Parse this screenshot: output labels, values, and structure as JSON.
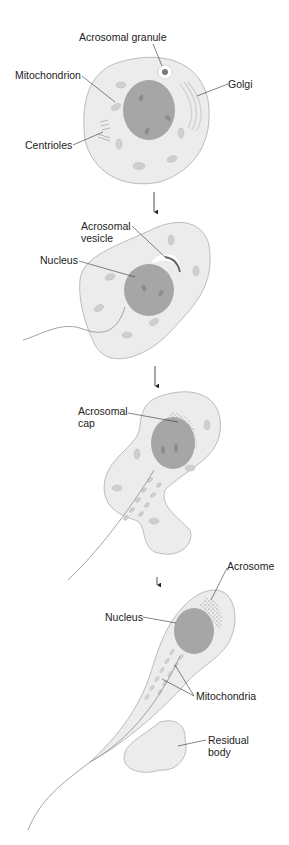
{
  "colors": {
    "cytoplasm": "#ececec",
    "outline": "#bcbcbc",
    "nucleus": "#a6a6a6",
    "organelle": "#cfcfcf",
    "leader": "#333333",
    "text": "#222222"
  },
  "stages": [
    {
      "id": 1,
      "labels": {
        "acrosomal_granule": "Acrosomal granule",
        "mitochondrion": "Mitochondrion",
        "golgi": "Golgi",
        "centrioles": "Centrioles"
      }
    },
    {
      "id": 2,
      "labels": {
        "acrosomal_vesicle": "Acrosomal\nvesicle",
        "nucleus": "Nucleus"
      }
    },
    {
      "id": 3,
      "labels": {
        "acrosomal_cap": "Acrosomal\ncap"
      }
    },
    {
      "id": 4,
      "labels": {
        "acrosome": "Acrosome",
        "nucleus": "Nucleus",
        "mitochondria": "Mitochondria",
        "residual_body": "Residual\nbody"
      }
    }
  ]
}
